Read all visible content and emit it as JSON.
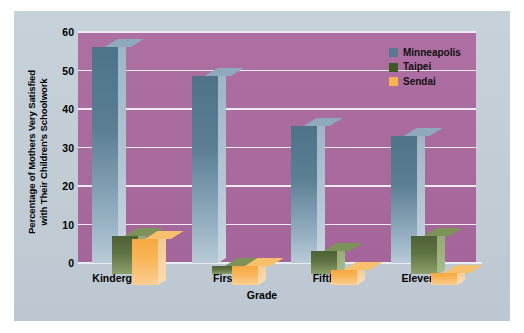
{
  "chart_data": {
    "type": "bar",
    "title": "",
    "xlabel": "Grade",
    "ylabel_lines": [
      "Percentage of Mothers Very Satisfied",
      "with Their Children's Schoolwork"
    ],
    "ylabel": "Percentage of Mothers Very Satisfied with Their Children's Schoolwork",
    "categories": [
      "Kindergarten",
      "First",
      "Fifth",
      "Eleventh"
    ],
    "series": [
      {
        "name": "Minneapolis",
        "color": "#57788e",
        "values": [
          56,
          48.5,
          35.5,
          33
        ]
      },
      {
        "name": "Taipei",
        "color": "#3f5a22",
        "values": [
          10,
          2,
          6,
          10
        ]
      },
      {
        "name": "Sendai",
        "color": "#f8b24e",
        "values": [
          12,
          5,
          4,
          3
        ]
      }
    ],
    "ylim": [
      0,
      60
    ],
    "yticks": [
      0,
      10,
      20,
      30,
      40,
      50,
      60
    ],
    "ytick_labels": [
      "0",
      "10",
      "20",
      "30",
      "40",
      "50",
      "60"
    ],
    "grid": true,
    "grid_color": "#f2eaf2",
    "legend_position": "top-right",
    "plot_background": "#a96a9d",
    "panel_background": "#c3cdd6",
    "figure_background": "#ffffff"
  }
}
